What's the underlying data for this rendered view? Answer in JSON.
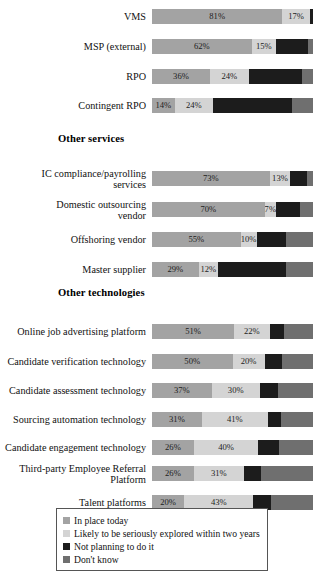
{
  "chart_data": {
    "type": "bar",
    "title": "",
    "subtitle": "",
    "xlabel": "",
    "ylabel": "",
    "stacked": true,
    "orientation": "horizontal",
    "grid": false,
    "xlim": [
      0,
      100
    ],
    "legend_position": "bottom",
    "series": [
      {
        "name": "In place today",
        "color": "#a3a3a3"
      },
      {
        "name": "Likely to be seriously explored within two years",
        "color": "#d4d4d4"
      },
      {
        "name": "Not planning to do it",
        "color": "#1c1c1c"
      },
      {
        "name": "Don't know",
        "color": "#6f6f6f"
      }
    ],
    "sections": [
      {
        "heading": "",
        "categories": [
          "VMS",
          "MSP (external)",
          "RPO",
          "Contingent RPO"
        ],
        "values": [
          [
            81,
            17,
            2,
            0
          ],
          [
            62,
            15,
            20,
            3
          ],
          [
            36,
            24,
            33,
            7
          ],
          [
            14,
            24,
            49,
            13
          ]
        ]
      },
      {
        "heading": "Other services",
        "categories": [
          "IC compliance/payrolling\nservices",
          "Domestic outsourcing\nvendor",
          "Offshoring vendor",
          "Master supplier"
        ],
        "values": [
          [
            73,
            13,
            10,
            4
          ],
          [
            70,
            7,
            15,
            8
          ],
          [
            55,
            10,
            18,
            17
          ],
          [
            29,
            12,
            42,
            17
          ]
        ]
      },
      {
        "heading": "Other technologies",
        "categories": [
          "Online job advertising platform",
          "Candidate verification technology",
          "Candidate assessment technology",
          "Sourcing automation technology",
          "Candidate engagement technology",
          "Third-party Employee Referral\nPlatform",
          "Talent platforms"
        ],
        "values": [
          [
            51,
            22,
            9,
            18
          ],
          [
            50,
            20,
            11,
            19
          ],
          [
            37,
            30,
            11,
            22
          ],
          [
            31,
            41,
            8,
            20
          ],
          [
            26,
            40,
            13,
            21
          ],
          [
            26,
            31,
            11,
            32
          ],
          [
            20,
            43,
            11,
            26
          ]
        ]
      }
    ]
  },
  "rows": [
    {
      "label": "VMS",
      "top": 6,
      "segments": [
        {
          "pct": 81,
          "text": "81%"
        },
        {
          "pct": 17,
          "text": "17%"
        },
        {
          "pct": 2,
          "text": ""
        },
        {
          "pct": 0,
          "text": ""
        }
      ]
    },
    {
      "label": "MSP (external)",
      "top": 36,
      "segments": [
        {
          "pct": 62,
          "text": "62%"
        },
        {
          "pct": 15,
          "text": "15%"
        },
        {
          "pct": 20,
          "text": ""
        },
        {
          "pct": 3,
          "text": ""
        }
      ]
    },
    {
      "label": "RPO",
      "top": 66,
      "segments": [
        {
          "pct": 36,
          "text": "36%"
        },
        {
          "pct": 24,
          "text": "24%"
        },
        {
          "pct": 33,
          "text": ""
        },
        {
          "pct": 7,
          "text": ""
        }
      ]
    },
    {
      "label": "Contingent RPO",
      "top": 95,
      "segments": [
        {
          "pct": 14,
          "text": "14%"
        },
        {
          "pct": 24,
          "text": "24%"
        },
        {
          "pct": 49,
          "text": ""
        },
        {
          "pct": 13,
          "text": ""
        }
      ]
    },
    {
      "label": "IC compliance/payrolling\nservices",
      "top": 168,
      "segments": [
        {
          "pct": 73,
          "text": "73%"
        },
        {
          "pct": 13,
          "text": "13%"
        },
        {
          "pct": 10,
          "text": ""
        },
        {
          "pct": 4,
          "text": ""
        }
      ]
    },
    {
      "label": "Domestic outsourcing\nvendor",
      "top": 199,
      "segments": [
        {
          "pct": 70,
          "text": "70%"
        },
        {
          "pct": 7,
          "text": "7%"
        },
        {
          "pct": 15,
          "text": ""
        },
        {
          "pct": 8,
          "text": ""
        }
      ]
    },
    {
      "label": "Offshoring vendor",
      "top": 229,
      "segments": [
        {
          "pct": 55,
          "text": "55%"
        },
        {
          "pct": 10,
          "text": "10%"
        },
        {
          "pct": 18,
          "text": ""
        },
        {
          "pct": 17,
          "text": ""
        }
      ]
    },
    {
      "label": "Master supplier",
      "top": 259,
      "segments": [
        {
          "pct": 29,
          "text": "29%"
        },
        {
          "pct": 12,
          "text": "12%"
        },
        {
          "pct": 42,
          "text": ""
        },
        {
          "pct": 17,
          "text": ""
        }
      ]
    },
    {
      "label": "Online job advertising platform",
      "top": 321,
      "segments": [
        {
          "pct": 51,
          "text": "51%"
        },
        {
          "pct": 22,
          "text": "22%"
        },
        {
          "pct": 9,
          "text": ""
        },
        {
          "pct": 18,
          "text": ""
        }
      ]
    },
    {
      "label": "Candidate verification technology",
      "top": 351,
      "segments": [
        {
          "pct": 50,
          "text": "50%"
        },
        {
          "pct": 20,
          "text": "20%"
        },
        {
          "pct": 11,
          "text": ""
        },
        {
          "pct": 19,
          "text": ""
        }
      ]
    },
    {
      "label": "Candidate assessment technology",
      "top": 380,
      "segments": [
        {
          "pct": 37,
          "text": "37%"
        },
        {
          "pct": 30,
          "text": "30%"
        },
        {
          "pct": 11,
          "text": ""
        },
        {
          "pct": 22,
          "text": ""
        }
      ]
    },
    {
      "label": "Sourcing automation technology",
      "top": 409,
      "segments": [
        {
          "pct": 31,
          "text": "31%"
        },
        {
          "pct": 41,
          "text": "41%"
        },
        {
          "pct": 8,
          "text": ""
        },
        {
          "pct": 20,
          "text": ""
        }
      ]
    },
    {
      "label": "Candidate engagement technology",
      "top": 437,
      "segments": [
        {
          "pct": 26,
          "text": "26%"
        },
        {
          "pct": 40,
          "text": "40%"
        },
        {
          "pct": 13,
          "text": ""
        },
        {
          "pct": 21,
          "text": ""
        }
      ]
    },
    {
      "label": "Third-party Employee Referral\nPlatform",
      "top": 463,
      "segments": [
        {
          "pct": 26,
          "text": "26%"
        },
        {
          "pct": 31,
          "text": "31%"
        },
        {
          "pct": 11,
          "text": ""
        },
        {
          "pct": 32,
          "text": ""
        }
      ]
    },
    {
      "label": "Talent platforms",
      "top": 492,
      "segments": [
        {
          "pct": 20,
          "text": "20%"
        },
        {
          "pct": 43,
          "text": "43%"
        },
        {
          "pct": 11,
          "text": ""
        },
        {
          "pct": 26,
          "text": ""
        }
      ]
    }
  ],
  "headings": [
    {
      "text": "Other services",
      "top": 133
    },
    {
      "text": "Other technologies",
      "top": 287
    }
  ],
  "legend": {
    "items": [
      {
        "label": "In place today",
        "color": "#a3a3a3"
      },
      {
        "label": "Likely to be seriously explored within two years",
        "color": "#d4d4d4"
      },
      {
        "label": "Not planning to do it",
        "color": "#1c1c1c"
      },
      {
        "label": "Don't know",
        "color": "#6f6f6f"
      }
    ]
  }
}
